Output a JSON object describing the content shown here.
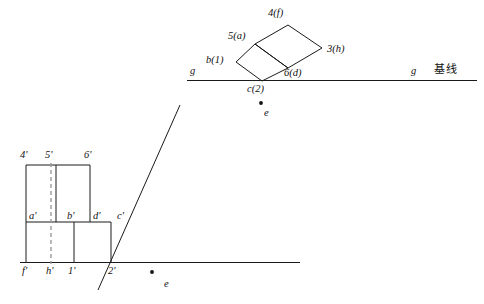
{
  "figure": {
    "title_text": "",
    "stroke_color": "#1a1a1a",
    "dashed_color": "#9a9a9a",
    "background": "#ffffff"
  },
  "upper_view": {
    "name": "top-view-rotated-squares",
    "baseline": {
      "left_label": "g",
      "right_label": "g",
      "caption": "基线",
      "y": 80,
      "x_start": 187,
      "x_end": 477
    },
    "vertices": {
      "top": "4(f)",
      "left": "5(a)",
      "right": "3(h)",
      "bottom": "6(d)",
      "outer_left": "b(1)",
      "apex_on_baseline": "c(2)"
    },
    "labels": [
      {
        "id": "v-4f",
        "text": "4(f)",
        "num": "4",
        "paren": "(f)"
      },
      {
        "id": "v-5a",
        "text": "5(a)",
        "num": "5",
        "paren": "(a)"
      },
      {
        "id": "v-3h",
        "text": "3(h)",
        "num": "3",
        "paren": "(h)"
      },
      {
        "id": "v-6d",
        "text": "6(d)",
        "num": "6",
        "paren": "(d)"
      },
      {
        "id": "v-b1",
        "text": "b(1)",
        "num": "1",
        "paren": "b"
      },
      {
        "id": "v-c2",
        "text": "c(2)",
        "num": "2",
        "paren": "c"
      }
    ],
    "point_e": "e"
  },
  "lower_view": {
    "name": "front-view-stepped-profile",
    "baseline": {
      "y": 262,
      "x_start": 20,
      "x_end": 300
    },
    "top_labels": [
      "4'",
      "5'",
      "6'"
    ],
    "mid_labels": [
      "a'",
      "b'",
      "d'",
      "c'"
    ],
    "bottom_labels": [
      "f'",
      "h'",
      "1'",
      "2'"
    ],
    "point_e": "e",
    "dashed_axis": "5'-h' center line"
  }
}
